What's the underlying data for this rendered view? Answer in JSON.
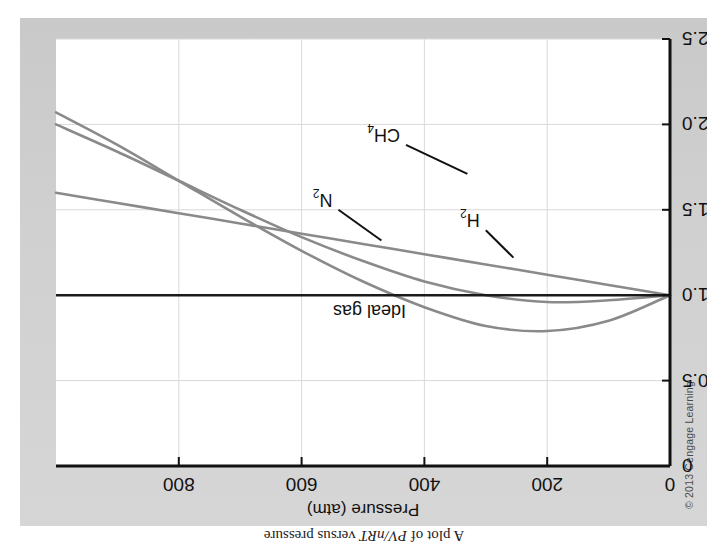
{
  "figure": {
    "caption_prefix": "A plot of ",
    "caption_formula": "PV/nRT",
    "caption_suffix": " versus pressure",
    "copyright": "© 2013 Cengage Learning",
    "card_color": "#d3d3d3",
    "plot_bg": "#ffffff"
  },
  "chart_data": {
    "type": "line",
    "title": "A plot of PV/nRT versus pressure",
    "xlabel": "Pressure (atm)",
    "ylabel": "PV/nRT",
    "ylabel_numerator": "PV",
    "ylabel_denominator": "nRT",
    "xlim": [
      0,
      1000
    ],
    "ylim": [
      0,
      2.5
    ],
    "xticks": [
      0,
      200,
      400,
      600,
      800
    ],
    "xtick_labels": [
      "0",
      "200",
      "400",
      "600",
      "800"
    ],
    "yticks": [
      0,
      0.5,
      1.0,
      1.5,
      2.0,
      2.5
    ],
    "ytick_labels": [
      "0",
      "0.5",
      "1.0",
      "1.5",
      "2.0",
      "2.5"
    ],
    "grid": true,
    "legend": "inline-annotations",
    "reference_line": {
      "name": "Ideal gas",
      "value": 1.0,
      "color": "#1a1a1a",
      "label": "Ideal gas",
      "label_x": 430,
      "label_y": 1.0
    },
    "series": [
      {
        "name": "CH4",
        "label": "CH",
        "label_sub": "4",
        "color": "#8a8a8a",
        "x": [
          0,
          100,
          200,
          300,
          400,
          500,
          600,
          700,
          800,
          900,
          1000
        ],
        "y": [
          1.0,
          0.85,
          0.79,
          0.82,
          0.93,
          1.08,
          1.26,
          1.46,
          1.67,
          1.88,
          2.07
        ],
        "leader_from": [
          430,
          1.88
        ],
        "leader_to": [
          330,
          1.71
        ]
      },
      {
        "name": "N2",
        "label": "N",
        "label_sub": "2",
        "color": "#8a8a8a",
        "x": [
          0,
          100,
          200,
          300,
          400,
          500,
          600,
          700,
          800,
          900,
          1000
        ],
        "y": [
          1.0,
          0.97,
          0.96,
          1.0,
          1.08,
          1.2,
          1.34,
          1.5,
          1.67,
          1.84,
          2.0
        ],
        "leader_from": [
          540,
          1.5
        ],
        "leader_to": [
          470,
          1.32
        ]
      },
      {
        "name": "H2",
        "label": "H",
        "label_sub": "2",
        "color": "#8a8a8a",
        "x": [
          0,
          100,
          200,
          300,
          400,
          500,
          600,
          700,
          800,
          900,
          1000
        ],
        "y": [
          1.0,
          1.06,
          1.12,
          1.18,
          1.24,
          1.3,
          1.36,
          1.42,
          1.48,
          1.54,
          1.6
        ],
        "leader_from": [
          300,
          1.38
        ],
        "leader_to": [
          255,
          1.22
        ]
      }
    ]
  }
}
